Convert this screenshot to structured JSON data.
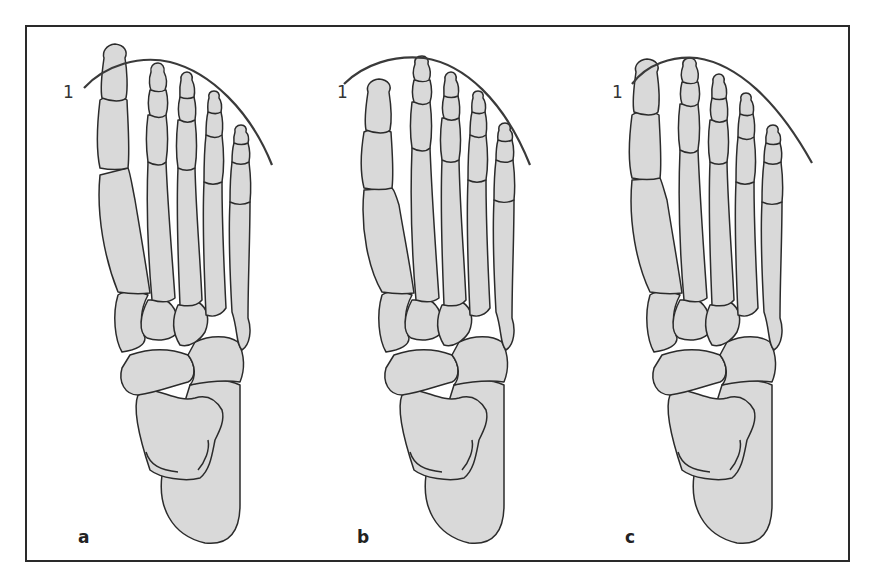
{
  "figure": {
    "type": "anatomical-diagram",
    "colors": {
      "bone_fill": "#d9d9d9",
      "outline": "#2b2b2b",
      "frame": "#2a2a2a",
      "background": "#ffffff"
    },
    "panels": [
      {
        "id": "a",
        "label": "a",
        "curve_label": "1",
        "description": "first toe longest"
      },
      {
        "id": "b",
        "label": "b",
        "curve_label": "1",
        "description": "second toe longest, first toe shorter"
      },
      {
        "id": "c",
        "label": "c",
        "curve_label": "1",
        "description": "first and second toes equal length"
      }
    ]
  }
}
